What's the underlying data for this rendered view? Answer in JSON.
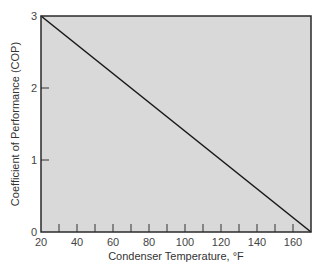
{
  "chart_data": {
    "type": "line",
    "title": "",
    "xlabel": "Condenser Temperature, °F",
    "ylabel": "Coefficient of Performance (COP)",
    "xlim": [
      20,
      170
    ],
    "ylim": [
      0,
      3
    ],
    "x_ticks": [
      20,
      40,
      60,
      80,
      100,
      120,
      140,
      160
    ],
    "x_minor_ticks": [
      30,
      40,
      50,
      60,
      70,
      80,
      90,
      100,
      110,
      120,
      130,
      140,
      150,
      160
    ],
    "y_ticks": [
      0,
      1,
      2,
      3
    ],
    "grid": false,
    "legend": null,
    "plot_background": "#d9d9d9",
    "line_color": "#1a1a1a",
    "series": [
      {
        "name": "COP",
        "x": [
          20,
          170
        ],
        "y": [
          3,
          0
        ]
      }
    ]
  }
}
